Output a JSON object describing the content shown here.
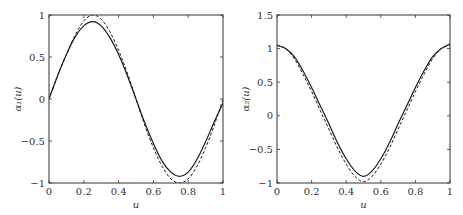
{
  "chart_data": [
    {
      "type": "line",
      "title": "",
      "xlabel": "u",
      "ylabel": "α₁(u)",
      "xlim": [
        0,
        1
      ],
      "ylim": [
        -1,
        1
      ],
      "xticks": [
        "0",
        "0.2",
        "0.4",
        "0.6",
        "0.8",
        "1"
      ],
      "yticks": [
        "−1",
        "−0.5",
        "0",
        "0.5",
        "1"
      ],
      "grid": false,
      "legend": null,
      "x": [
        0,
        0.05,
        0.1,
        0.15,
        0.2,
        0.25,
        0.3,
        0.35,
        0.4,
        0.45,
        0.5,
        0.55,
        0.6,
        0.65,
        0.7,
        0.75,
        0.8,
        0.85,
        0.9,
        0.95,
        1
      ],
      "series": [
        {
          "name": "estimate",
          "style": "solid",
          "values": [
            0.0,
            0.28,
            0.53,
            0.74,
            0.87,
            0.92,
            0.87,
            0.73,
            0.53,
            0.28,
            0.0,
            -0.28,
            -0.53,
            -0.74,
            -0.87,
            -0.92,
            -0.87,
            -0.72,
            -0.51,
            -0.27,
            -0.05
          ]
        },
        {
          "name": "true",
          "style": "dashed",
          "values": [
            0.0,
            0.28,
            0.53,
            0.76,
            0.93,
            1.0,
            0.95,
            0.8,
            0.58,
            0.31,
            0.0,
            -0.31,
            -0.58,
            -0.8,
            -0.95,
            -1.0,
            -0.95,
            -0.8,
            -0.58,
            -0.31,
            0.0
          ]
        }
      ]
    },
    {
      "type": "line",
      "title": "",
      "xlabel": "u",
      "ylabel": "α₂(u)",
      "xlim": [
        0,
        1
      ],
      "ylim": [
        -1,
        1.5
      ],
      "xticks": [
        "0",
        "0.2",
        "0.4",
        "0.6",
        "0.8",
        "1"
      ],
      "yticks": [
        "−1",
        "−0.5",
        "0",
        "0.5",
        "1",
        "1.5"
      ],
      "grid": false,
      "legend": null,
      "x": [
        0,
        0.05,
        0.1,
        0.15,
        0.2,
        0.25,
        0.3,
        0.35,
        0.4,
        0.45,
        0.5,
        0.55,
        0.6,
        0.65,
        0.7,
        0.75,
        0.8,
        0.85,
        0.9,
        0.95,
        1
      ],
      "series": [
        {
          "name": "estimate",
          "style": "solid",
          "values": [
            1.05,
            1.0,
            0.88,
            0.67,
            0.42,
            0.15,
            -0.12,
            -0.4,
            -0.64,
            -0.82,
            -0.9,
            -0.82,
            -0.64,
            -0.4,
            -0.12,
            0.15,
            0.42,
            0.67,
            0.88,
            1.0,
            1.07
          ]
        },
        {
          "name": "true",
          "style": "dashed",
          "values": [
            1.05,
            1.0,
            0.85,
            0.62,
            0.36,
            0.08,
            -0.2,
            -0.48,
            -0.72,
            -0.9,
            -0.98,
            -0.9,
            -0.72,
            -0.48,
            -0.2,
            0.08,
            0.36,
            0.62,
            0.85,
            1.0,
            1.05
          ]
        }
      ]
    }
  ],
  "layout": {
    "panels": [
      {
        "left": 49,
        "right": 223,
        "top": 15,
        "bottom": 183
      },
      {
        "left": 277,
        "right": 450,
        "top": 15,
        "bottom": 183
      }
    ]
  }
}
